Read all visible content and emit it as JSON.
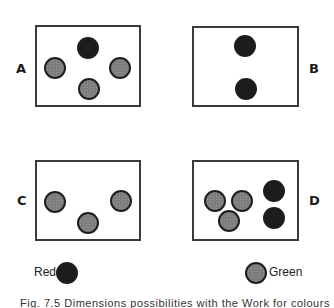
{
  "figure": {
    "panels": [
      {
        "id": "A",
        "label": "A",
        "box": [
          35,
          25,
          106,
          82
        ],
        "label_pos": [
          16,
          61
        ],
        "dots": [
          {
            "color": "red",
            "x": 77,
            "y": 37
          },
          {
            "color": "green",
            "x": 44,
            "y": 57
          },
          {
            "color": "green",
            "x": 109,
            "y": 57
          },
          {
            "color": "green",
            "x": 78,
            "y": 78
          }
        ]
      },
      {
        "id": "B",
        "label": "B",
        "box": [
          192,
          26,
          107,
          81
        ],
        "label_pos": [
          309,
          61
        ],
        "dots": [
          {
            "color": "red",
            "x": 234,
            "y": 35
          },
          {
            "color": "red",
            "x": 235,
            "y": 78
          }
        ]
      },
      {
        "id": "C",
        "label": "C",
        "box": [
          35,
          160,
          106,
          81
        ],
        "label_pos": [
          17,
          193
        ],
        "dots": [
          {
            "color": "green",
            "x": 44,
            "y": 191
          },
          {
            "color": "green",
            "x": 110,
            "y": 190
          },
          {
            "color": "green",
            "x": 77,
            "y": 212
          }
        ]
      },
      {
        "id": "D",
        "label": "D",
        "box": [
          192,
          160,
          107,
          81
        ],
        "label_pos": [
          309,
          193
        ],
        "dots": [
          {
            "color": "green",
            "x": 204,
            "y": 190
          },
          {
            "color": "green",
            "x": 231,
            "y": 190
          },
          {
            "color": "green",
            "x": 218,
            "y": 210
          },
          {
            "color": "red",
            "x": 263,
            "y": 180
          },
          {
            "color": "red",
            "x": 263,
            "y": 207
          }
        ]
      }
    ],
    "legend": [
      {
        "label": "Red",
        "color": "red"
      },
      {
        "label": "Green",
        "color": "green"
      }
    ],
    "caption": "Fig. 7.5  Dimensions possibilities with the Work for colours"
  },
  "colors": {
    "red_fill": "#1c1c1c",
    "green_fill": "#8c8c8c",
    "outline": "#3a3a3a"
  }
}
